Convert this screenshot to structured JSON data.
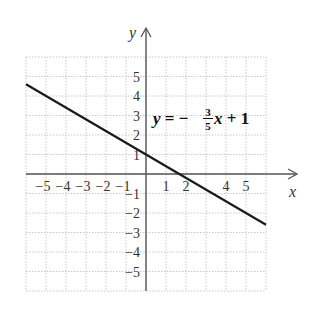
{
  "chart_data": {
    "type": "line",
    "title": "",
    "xlabel": "x",
    "ylabel": "y",
    "xlim": [
      -6,
      6
    ],
    "ylim": [
      -6,
      6
    ],
    "grid": true,
    "x_ticks": [
      "−5",
      "−4",
      "−3",
      "−2",
      "−1",
      "1",
      "2",
      "4",
      "5"
    ],
    "x_tick_values": [
      -5,
      -4,
      -3,
      -2,
      -1,
      1,
      2,
      4,
      5
    ],
    "y_ticks": [
      "5",
      "4",
      "3",
      "2",
      "1",
      "−1",
      "−2",
      "−3",
      "−4",
      "−5"
    ],
    "y_tick_values": [
      5,
      4,
      3,
      2,
      1,
      -1,
      -2,
      -3,
      -4,
      -5
    ],
    "series": [
      {
        "name": "y = −3/5 x + 1",
        "equation": "y = -(3/5)x + 1",
        "slope": -0.6,
        "intercept": 1,
        "x": [
          -6,
          6
        ],
        "y": [
          4.6,
          -2.6
        ]
      }
    ],
    "annotations": [
      {
        "text_lhs": "y = −",
        "frac_num": "3",
        "frac_den": "5",
        "text_rhs": "x + 1",
        "x": 0.3,
        "y": 2.6
      }
    ]
  },
  "colors": {
    "line": "#1a1a1a",
    "axis": "#555555",
    "grid": "#c8c8c8"
  }
}
